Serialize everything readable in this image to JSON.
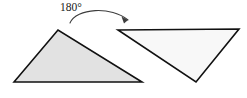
{
  "figure": {
    "kind": "geometry-transformation-diagram",
    "background_color": "#ffffff",
    "width": 247,
    "height": 98,
    "annotation": {
      "label": "180°",
      "label_x": 60,
      "label_y": 11,
      "color": "#1a1a1a"
    },
    "arrow": {
      "name": "rotation-arrow",
      "path": "M 70 23 C 76 8, 112 6, 128 20",
      "color": "#3d3d3d",
      "stroke_width": 1.1,
      "head_points": "128,20 121.5,16.5 124,23.5",
      "head_color": "#3d3d3d"
    },
    "shapes": [
      {
        "name": "pre-image-triangle",
        "role": "pre-image",
        "points": "14,82 58,30 142,82",
        "fill": "#e2e2e2",
        "stroke": "#111111",
        "stroke_width": 1.6
      },
      {
        "name": "image-triangle",
        "role": "image",
        "points": "118,30 239,29 196,82",
        "fill": "#f8f8f8",
        "stroke": "#111111",
        "stroke_width": 1.6
      }
    ]
  }
}
